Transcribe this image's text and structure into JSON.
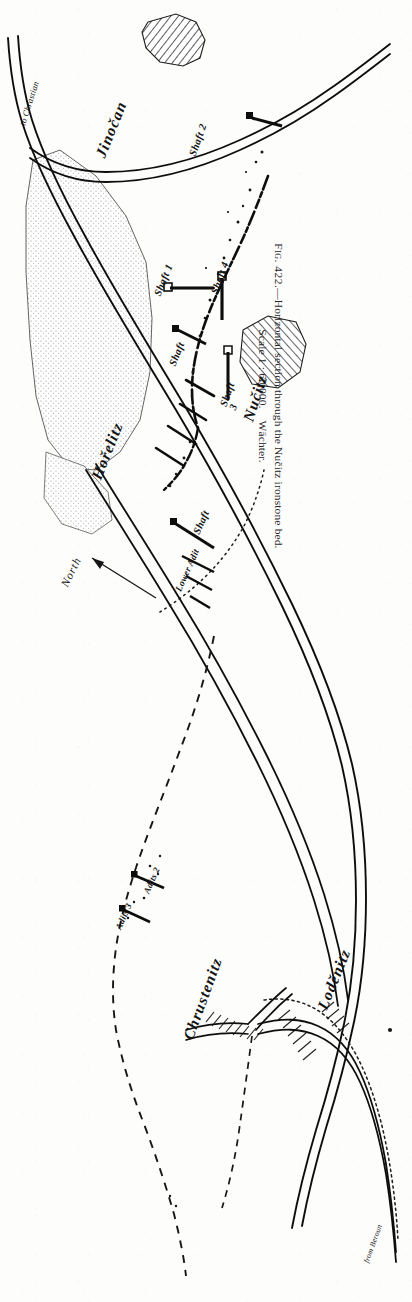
{
  "figure": {
    "number_label": "Fig. 422.",
    "caption_line1": "Fig. 422.—Horizontal section through the Nučitz ironstone bed.",
    "caption_line2": "Scale 1 : 60,000.   Wächter.",
    "caption_dash": "—",
    "caption_title": "Horizontal section through the Nučitz ironstone bed.",
    "scale_text": "Scale 1 : 60,000.",
    "author": "Wächter.",
    "orientation_note": "North"
  },
  "map": {
    "north_arrow_label": "North",
    "places": [
      {
        "id": "jinocan",
        "name": "Jinočan",
        "type": "village"
      },
      {
        "id": "horelitz",
        "name": "Hořelitz",
        "type": "village"
      },
      {
        "id": "nucitz",
        "name": "Nučitz",
        "type": "village"
      },
      {
        "id": "chrustenitz",
        "name": "Chrustenitz",
        "type": "village"
      },
      {
        "id": "lodenitz",
        "name": "Loděnitz",
        "type": "village"
      }
    ],
    "routes": [
      {
        "id": "to-chrastian",
        "label": "to Chrastian",
        "type": "railway"
      },
      {
        "id": "from-beroun",
        "label": "from Beroun",
        "type": "railway"
      }
    ],
    "workings": [
      {
        "id": "shaft-1",
        "label": "Shaft 1",
        "type": "shaft"
      },
      {
        "id": "shaft-2",
        "label": "Shaft 2",
        "type": "shaft"
      },
      {
        "id": "shaft-3",
        "label": "Shaft 3",
        "type": "shaft"
      },
      {
        "id": "shaft-4",
        "label": "Shaft 4",
        "type": "shaft"
      },
      {
        "id": "shaft-5",
        "label": "Shaft",
        "type": "shaft"
      },
      {
        "id": "shaft-6",
        "label": "Shaft",
        "type": "shaft"
      },
      {
        "id": "lower-adit",
        "label": "Lower Adit",
        "type": "adit"
      },
      {
        "id": "adits-2",
        "label": "Adits 2",
        "type": "adit"
      },
      {
        "id": "adits-3",
        "label": "Adits 3",
        "type": "adit"
      }
    ],
    "colors": {
      "ink": "#141414",
      "paper": "#fdfdfb",
      "stipple": "#9a9a96",
      "hatch": "#2a2a2a"
    }
  }
}
